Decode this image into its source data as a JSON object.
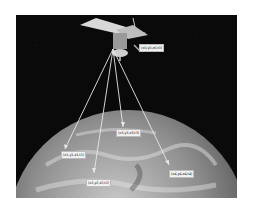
{
  "figure": {
    "satellite_label": "(x0,y0,z0,t0)",
    "receiver_labels": [
      {
        "id": "r1",
        "text": "(x1,y1,z1,t1)"
      },
      {
        "id": "r2",
        "text": "(x2,y2,z2,t2)"
      },
      {
        "id": "r3",
        "text": "(x3,y3,z3,t3)"
      },
      {
        "id": "r4",
        "text": "(x4,y4,z4,t4)"
      }
    ]
  },
  "colors": {
    "space": "#0a0a0a",
    "earth": "#8a8a8a",
    "beam": "#e8e8e8",
    "label_bg": "#f2f2f2"
  }
}
